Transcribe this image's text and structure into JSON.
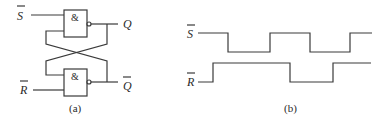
{
  "figure_a": {
    "caption": "(a)",
    "gate_symbol": "&",
    "inputs": {
      "set": "S",
      "reset": "R"
    },
    "outputs": {
      "q": "Q",
      "q_bar": "Q"
    },
    "description": "SR latch built from two cross-coupled NAND gates"
  },
  "figure_b": {
    "caption": "(b)",
    "signals": [
      {
        "name": "S",
        "overbar": true,
        "initial": "high",
        "transitions_x": [
          228,
          270,
          310,
          350
        ]
      },
      {
        "name": "R",
        "overbar": true,
        "initial": "low",
        "transitions_x": [
          213,
          290,
          333
        ]
      }
    ],
    "description": "Input timing waveforms for S-bar and R-bar"
  },
  "colors": {
    "line": "#3a3a3a",
    "text": "#2a2a2a",
    "background": "#ffffff"
  }
}
